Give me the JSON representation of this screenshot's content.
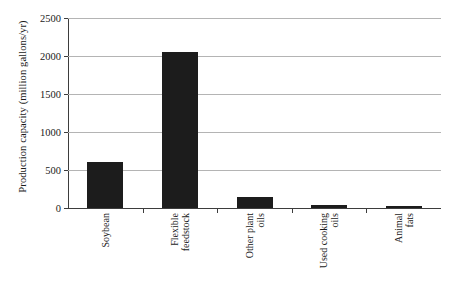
{
  "chart_data": {
    "type": "bar",
    "title": "",
    "xlabel": "",
    "ylabel": "Production capacity (million gallons/yr)",
    "categories": [
      "Soybean",
      "Flexible feedstock",
      "Other plant oils",
      "Used cooking oils",
      "Animal fats"
    ],
    "category_lines": [
      [
        "Soybean",
        ""
      ],
      [
        "Flexible",
        "feedstock"
      ],
      [
        "Other plant",
        "oils"
      ],
      [
        "Used cooking",
        "oils"
      ],
      [
        "Animal",
        "fats"
      ]
    ],
    "values": [
      600,
      2050,
      150,
      35,
      25
    ],
    "ylim": [
      0,
      2500
    ],
    "yticks": [
      0,
      500,
      1000,
      1500,
      2000,
      2500
    ],
    "ytick_labels": [
      "0",
      "500",
      "1000",
      "1500",
      "2000",
      "2500"
    ],
    "grid": "horizontal",
    "legend": "none",
    "bar_color": "#1c1c1c",
    "gridline_color": "#b4b4b4",
    "axis_color": "#3d3d3d",
    "background_color": "#ffffff"
  }
}
